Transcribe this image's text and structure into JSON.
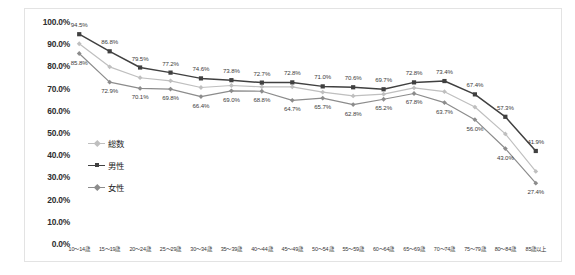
{
  "chart_data": {
    "type": "line",
    "title": "",
    "xlabel": "",
    "ylabel": "",
    "ylim": [
      0,
      100
    ],
    "yticks": [
      "0.0%",
      "10.0%",
      "20.0%",
      "30.0%",
      "40.0%",
      "50.0%",
      "60.0%",
      "70.0%",
      "80.0%",
      "90.0%",
      "100.0%"
    ],
    "grid": false,
    "legend_position": "inside-left",
    "categories": [
      "10〜14歳",
      "15〜19歳",
      "20〜24歳",
      "25〜29歳",
      "30〜34歳",
      "35〜39歳",
      "40〜44歳",
      "45〜49歳",
      "50〜54歳",
      "55〜59歳",
      "60〜64歳",
      "65〜69歳",
      "70〜74歳",
      "75〜79歳",
      "80〜84歳",
      "85歳以上"
    ],
    "series": [
      {
        "name": "総数",
        "color": "#bfbfbf",
        "marker": "diamond",
        "labels_shown": false,
        "values": [
          90.2,
          79.8,
          74.9,
          73.5,
          70.5,
          71.4,
          70.8,
          70.8,
          68.4,
          66.7,
          67.5,
          70.3,
          68.6,
          61.7,
          49.6,
          32.7
        ]
      },
      {
        "name": "男性",
        "color": "#404040",
        "marker": "square",
        "labels_shown": true,
        "labels_position": "above",
        "values": [
          94.5,
          86.8,
          79.5,
          77.2,
          74.6,
          73.8,
          72.7,
          72.8,
          71.0,
          70.6,
          69.7,
          72.8,
          73.4,
          67.4,
          57.3,
          41.9
        ],
        "value_labels": [
          "94.5%",
          "86.8%",
          "79.5%",
          "77.2%",
          "74.6%",
          "73.8%",
          "72.7%",
          "72.8%",
          "71.0%",
          "70.6%",
          "69.7%",
          "72.8%",
          "73.4%",
          "67.4%",
          "57.3%",
          "41.9%"
        ]
      },
      {
        "name": "女性",
        "color": "#8c8c8c",
        "marker": "diamond",
        "labels_shown": true,
        "labels_position": "below",
        "values": [
          85.8,
          72.9,
          70.1,
          69.8,
          66.4,
          69.0,
          68.8,
          64.7,
          65.7,
          62.8,
          65.2,
          67.8,
          63.7,
          56.0,
          43.0,
          27.4
        ],
        "value_labels": [
          "85.8%",
          "72.9%",
          "70.1%",
          "69.8%",
          "66.4%",
          "69.0%",
          "68.8%",
          "64.7%",
          "65.7%",
          "62.8%",
          "65.2%",
          "67.8%",
          "63.7%",
          "56.0%",
          "43.0%",
          "27.4%"
        ]
      }
    ]
  },
  "legend": {
    "items": [
      {
        "label": "総数",
        "color": "#bfbfbf"
      },
      {
        "label": "男性",
        "color": "#404040"
      },
      {
        "label": "女性",
        "color": "#8c8c8c"
      }
    ]
  }
}
